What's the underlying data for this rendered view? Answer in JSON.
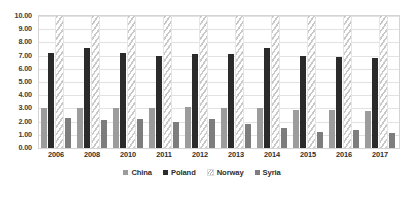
{
  "chart_data": {
    "type": "bar",
    "title": "",
    "subtitle": "",
    "xlabel": "",
    "ylabel": "",
    "categories": [
      "2006",
      "2008",
      "2010",
      "2011",
      "2012",
      "2013",
      "2014",
      "2015",
      "2016",
      "2017"
    ],
    "ylim": [
      0,
      10
    ],
    "ytick_step": 1,
    "ytick_labels": [
      "10.00",
      "9.00",
      "8.00",
      "7.00",
      "6.00",
      "5.00",
      "4.00",
      "3.00",
      "2.00",
      "1.00",
      "0.00"
    ],
    "ytick_values": [
      10,
      9,
      8,
      7,
      6,
      5,
      4,
      3,
      2,
      1,
      0
    ],
    "grid": true,
    "grid_axis": "y",
    "legend_position": "bottom",
    "note": "Norway bars are clipped by the 10.00 axis maximum; their true values exceed the plotted range.",
    "series": [
      {
        "name": "China",
        "color": "#9c9c9c",
        "pattern": "solid",
        "values": [
          3.0,
          3.0,
          3.0,
          3.0,
          3.1,
          3.0,
          3.0,
          2.9,
          2.9,
          2.8
        ]
      },
      {
        "name": "Poland",
        "color": "#2b2b2b",
        "pattern": "solid",
        "values": [
          7.2,
          7.6,
          7.2,
          7.0,
          7.1,
          7.1,
          7.6,
          7.0,
          6.9,
          6.8
        ]
      },
      {
        "name": "Norway",
        "color": "#ffffff",
        "pattern": "diagonal-hatch",
        "values": [
          10.0,
          10.0,
          10.0,
          10.0,
          10.0,
          10.0,
          10.0,
          10.0,
          10.0,
          10.0
        ]
      },
      {
        "name": "Syria",
        "color": "#7d7d7d",
        "pattern": "solid",
        "values": [
          2.3,
          2.1,
          2.2,
          2.0,
          2.2,
          1.8,
          1.5,
          1.2,
          1.4,
          1.1
        ]
      }
    ]
  },
  "legend": {
    "items": [
      {
        "label": "China",
        "key": "china"
      },
      {
        "label": "Poland",
        "key": "poland"
      },
      {
        "label": "Norway",
        "key": "norway"
      },
      {
        "label": "Syria",
        "key": "syria"
      }
    ]
  }
}
